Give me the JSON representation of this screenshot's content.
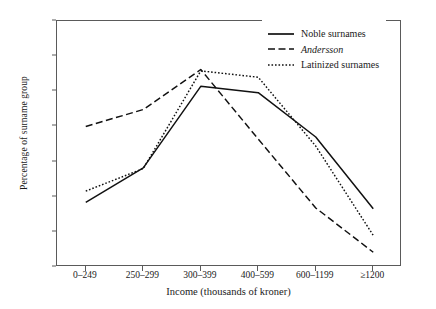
{
  "chart_data": {
    "type": "line",
    "title": "",
    "xlabel": "Income (thousands of kroner)",
    "ylabel": "Percentage of surname group",
    "categories": [
      "0–249",
      "250–299",
      "300–399",
      "400–599",
      "600–1199",
      "≥1200"
    ],
    "ylim": [
      0,
      35
    ],
    "ytick_values": [
      0,
      5,
      10,
      15,
      20,
      25,
      30,
      35
    ],
    "ytick_labels": [
      "0",
      "5",
      "10",
      "15",
      "20",
      "25",
      "30",
      "35"
    ],
    "grid": false,
    "legend_position": "top-right-inside",
    "series": [
      {
        "name": "Noble surnames",
        "style": "solid",
        "italic": false,
        "color": "#111111",
        "values": [
          9.2,
          14.1,
          25.7,
          24.8,
          18.5,
          8.3
        ]
      },
      {
        "name": "Andersson",
        "style": "dashed",
        "italic": true,
        "color": "#111111",
        "values": [
          20.0,
          22.4,
          28.1,
          18.2,
          8.4,
          2.1
        ]
      },
      {
        "name": "Latinized surnames",
        "style": "dotted",
        "italic": false,
        "color": "#111111",
        "values": [
          10.8,
          14.0,
          27.9,
          27.0,
          17.2,
          4.5
        ]
      }
    ]
  }
}
